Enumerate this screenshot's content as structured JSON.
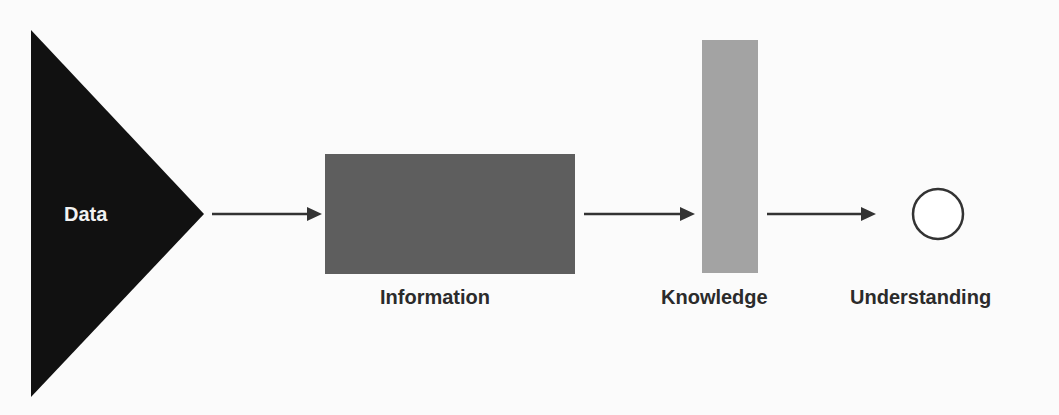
{
  "diagram": {
    "title": "",
    "nodes": [
      {
        "id": "data",
        "label": "Data",
        "shape": "triangle",
        "fill": "#111111"
      },
      {
        "id": "information",
        "label": "Information",
        "shape": "wide-rectangle",
        "fill": "#5e5e5e"
      },
      {
        "id": "knowledge",
        "label": "Knowledge",
        "shape": "tall-narrow-rectangle",
        "fill": "#a3a3a3"
      },
      {
        "id": "understanding",
        "label": "Understanding",
        "shape": "circle",
        "fill": "#ffffff",
        "stroke": "#333333"
      }
    ],
    "edges": [
      {
        "from": "data",
        "to": "information"
      },
      {
        "from": "information",
        "to": "knowledge"
      },
      {
        "from": "knowledge",
        "to": "understanding"
      }
    ],
    "colors": {
      "background": "#fbfbfb",
      "arrow": "#333333",
      "label_text": "#2b2b2b",
      "data_label_text": "#f2f2f2"
    }
  }
}
